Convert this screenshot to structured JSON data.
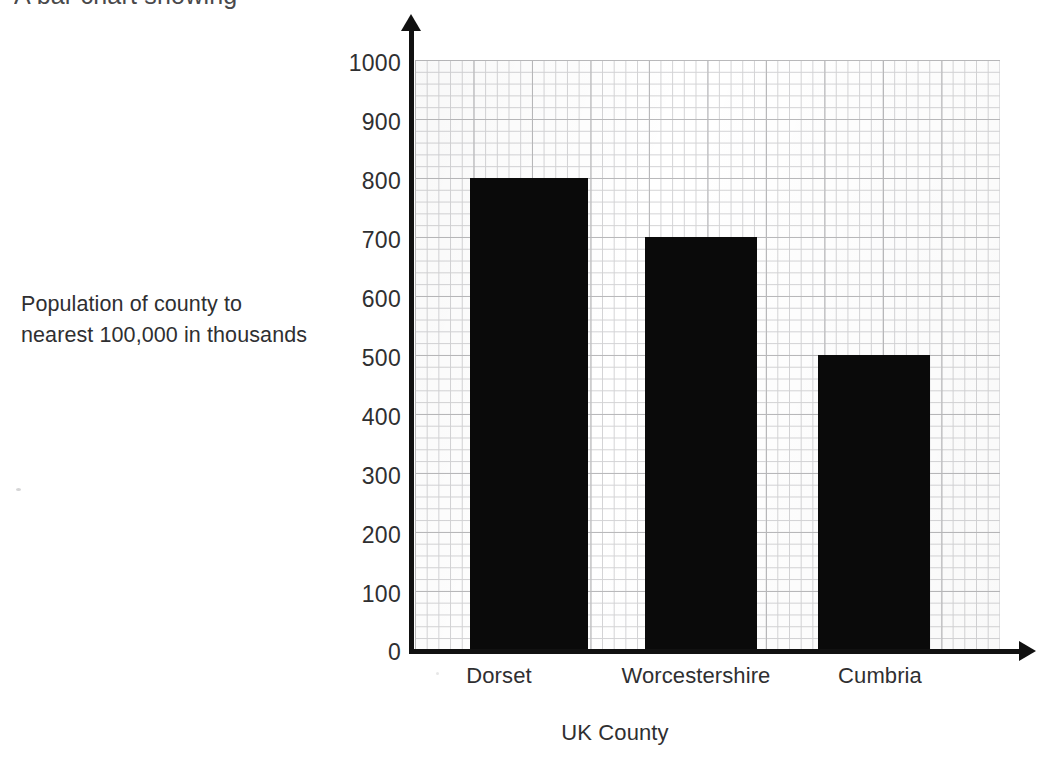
{
  "page": {
    "cropped_heading_fragment": "A bar chart showing"
  },
  "axis": {
    "y_caption_line1": "Population of county to",
    "y_caption_line2": "nearest 100,000 in thousands",
    "x_caption": "UK County"
  },
  "chart_data": {
    "type": "bar",
    "title": "",
    "xlabel": "UK County",
    "ylabel": "Population of county to nearest 100,000 in thousands",
    "categories": [
      "Dorset",
      "Worcestershire",
      "Cumbria"
    ],
    "values": [
      800,
      700,
      500
    ],
    "ylim": [
      0,
      1000
    ],
    "yticks": [
      0,
      100,
      200,
      300,
      400,
      500,
      600,
      700,
      800,
      900,
      1000
    ],
    "ytick_labels": [
      "0",
      "100",
      "200",
      "300",
      "400",
      "500",
      "600",
      "700",
      "800",
      "900",
      "1000"
    ],
    "grid": true,
    "grid_style": "graph-paper",
    "legend": null,
    "bar_color": "#0a0a0a",
    "grid_major_color": "#b9b9bb",
    "grid_minor_color": "#d3d3d5",
    "axis_color": "#111111",
    "text_color": "#2f2f31",
    "background": "#ffffff"
  }
}
